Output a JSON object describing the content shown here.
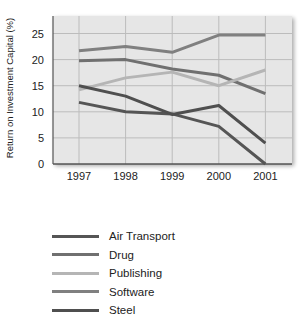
{
  "chart_data": {
    "type": "line",
    "title": "",
    "xlabel": "",
    "ylabel": "Return on Investment Capital (%)",
    "x": [
      "1997",
      "1998",
      "1999",
      "2000",
      "2001"
    ],
    "yticks": [
      0,
      5,
      10,
      15,
      20,
      25
    ],
    "ylim": [
      0,
      27
    ],
    "grid": true,
    "legend_position": "bottom",
    "series": [
      {
        "name": "Air Transport",
        "color": "#555555",
        "values": [
          11.8,
          10.0,
          9.6,
          7.2,
          0.0
        ]
      },
      {
        "name": "Drug",
        "color": "#707070",
        "values": [
          19.8,
          20.0,
          18.2,
          17.0,
          13.5
        ]
      },
      {
        "name": "Publishing",
        "color": "#b5b5b5",
        "values": [
          14.2,
          16.5,
          17.6,
          15.0,
          18.0
        ]
      },
      {
        "name": "Software",
        "color": "#808080",
        "values": [
          21.7,
          22.5,
          21.4,
          24.7,
          24.7
        ]
      },
      {
        "name": "Steel",
        "color": "#4f4f4f",
        "values": [
          15.0,
          13.0,
          9.5,
          11.2,
          4.0
        ]
      }
    ]
  },
  "legend": {
    "items": [
      {
        "label": "Air Transport"
      },
      {
        "label": "Drug"
      },
      {
        "label": "Publishing"
      },
      {
        "label": "Software"
      },
      {
        "label": "Steel"
      }
    ]
  },
  "colors": {
    "plot_background": "#e6e6e6",
    "gridline": "#bcbcbc",
    "axis": "#555555"
  }
}
